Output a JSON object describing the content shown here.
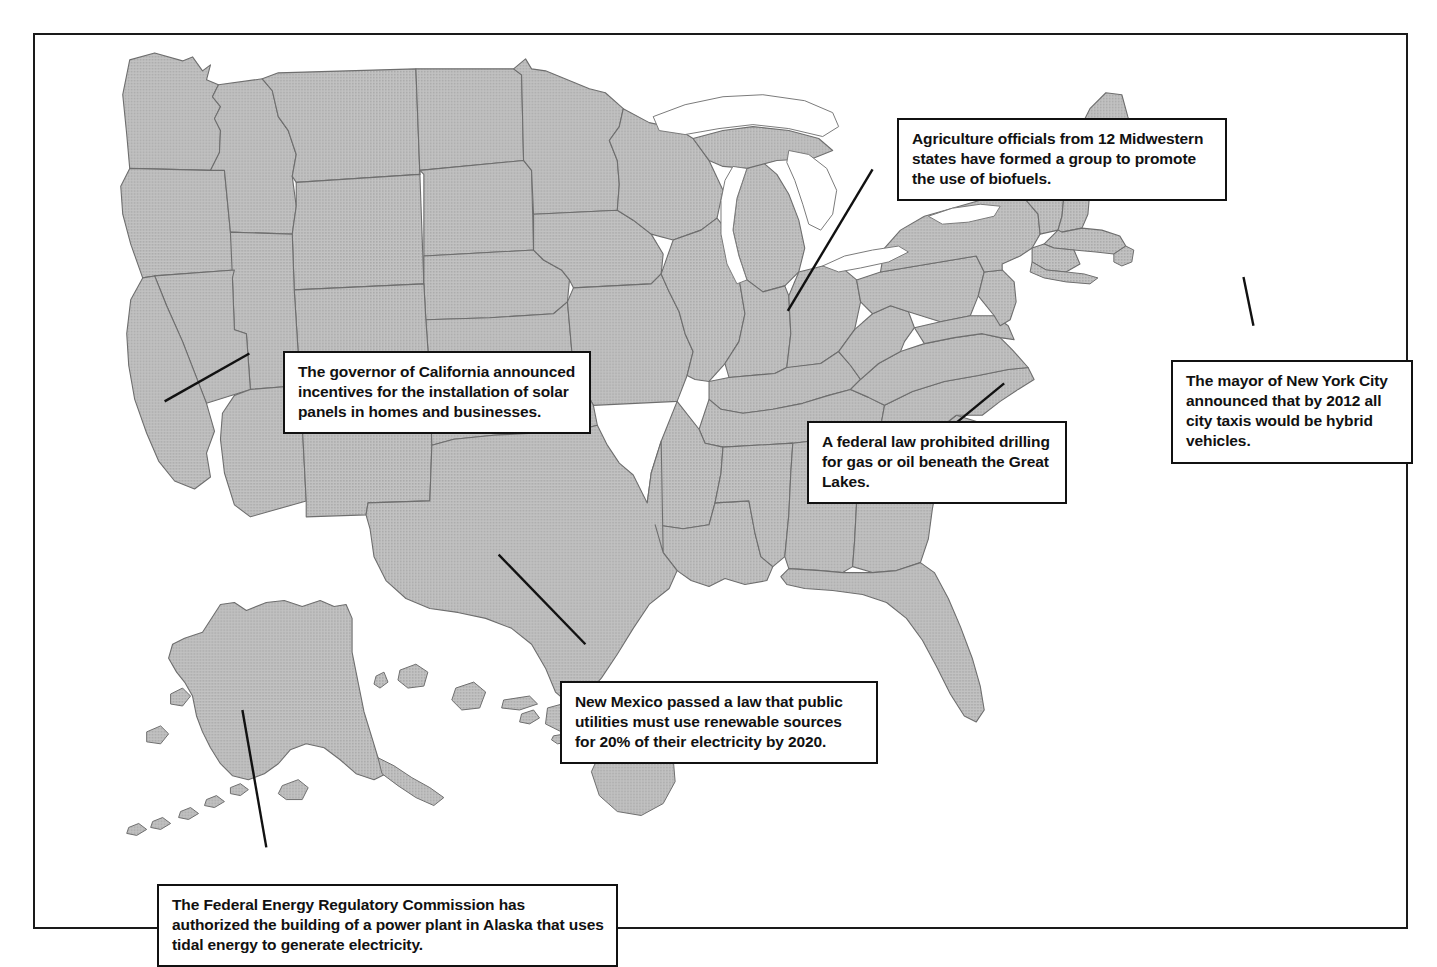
{
  "figure": {
    "kind": "map",
    "frame_color": "#1a1a1a",
    "land_fill_color": "#b9b9b9",
    "border_color": "#6e6e6e",
    "water_color": "#ffffff",
    "leader_color": "#111111"
  },
  "map": {
    "region": "United States",
    "includes_insets": [
      "Alaska",
      "Hawaii"
    ],
    "features_shown": [
      "state-borders",
      "great-lakes",
      "coastlines"
    ]
  },
  "callouts": [
    {
      "id": "biofuels",
      "name": "callout-biofuels",
      "text": "Agriculture officials from 12 Midwestern states have formed a group to promote the use of biofuels.",
      "anchor_region": "Midwest / Wisconsin"
    },
    {
      "id": "california",
      "name": "callout-california",
      "text": "The governor of California announced incentives for the installation of solar panels in homes and businesses.",
      "anchor_region": "California"
    },
    {
      "id": "nyc",
      "name": "callout-nyc",
      "text": "The mayor of New York City announced that by 2012 all city taxis would be hybrid vehicles.",
      "anchor_region": "New York City"
    },
    {
      "id": "greatlakes",
      "name": "callout-greatlakes",
      "text": "A federal law prohibited drilling for gas or oil beneath the Great Lakes.",
      "anchor_region": "Lake Michigan"
    },
    {
      "id": "newmexico",
      "name": "callout-newmexico",
      "text": "New Mexico passed a law that public utilities must use renewable sources for 20% of their electricity by 2020.",
      "anchor_region": "New Mexico"
    },
    {
      "id": "alaska",
      "name": "callout-alaska",
      "text": "The Federal Energy Regulatory Commission has authorized the building of a power plant in Alaska that uses tidal energy to generate electricity.",
      "anchor_region": "Alaska"
    }
  ]
}
